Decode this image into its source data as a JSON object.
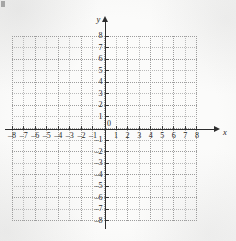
{
  "figure": {
    "kind": "cartesian-coordinate-grid",
    "axis_color": "#2e2e2e",
    "grid_color": "#b9b9b9",
    "background_color": "#fbfbfa"
  },
  "axes": {
    "x_name": "x",
    "y_name": "y",
    "origin_label": "0"
  },
  "chart_data": {
    "type": "scatter",
    "title": "",
    "subtitle": "",
    "xlabel": "x",
    "ylabel": "y",
    "xlim": [
      -8,
      8
    ],
    "ylim": [
      -8,
      8
    ],
    "xticks": [
      -8,
      -7,
      -6,
      -5,
      -4,
      -3,
      -2,
      -1,
      0,
      1,
      2,
      3,
      4,
      5,
      6,
      7,
      8
    ],
    "yticks": [
      8,
      7,
      6,
      5,
      4,
      3,
      2,
      1,
      0,
      -1,
      -2,
      -3,
      -4,
      -5,
      -6,
      -7,
      -8
    ],
    "xtick_labels": [
      "–8",
      "–7",
      "–6",
      "–5",
      "–4",
      "–3",
      "–2",
      "–1",
      "0",
      "1",
      "2",
      "3",
      "4",
      "5",
      "6",
      "7",
      "8"
    ],
    "ytick_labels": [
      "8",
      "7",
      "6",
      "5",
      "4",
      "3",
      "2",
      "1",
      "0",
      "–1",
      "–2",
      "–3",
      "–4",
      "–5",
      "–6",
      "–7",
      "–8"
    ],
    "grid": true,
    "grid_style": "dotted",
    "grid_spacing": 1,
    "legend": false,
    "legend_position": "none",
    "series": [],
    "annotations": [],
    "axis_arrows": [
      "x-positive",
      "y-positive"
    ]
  }
}
